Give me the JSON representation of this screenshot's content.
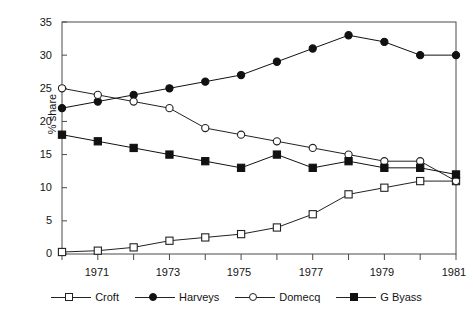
{
  "chart_data": {
    "type": "line",
    "title": "",
    "subtitle": "",
    "xlabel": "",
    "ylabel": "% share",
    "xlim": [
      1970,
      1981
    ],
    "ylim": [
      0,
      35
    ],
    "yticks": [
      0,
      5,
      10,
      15,
      20,
      25,
      30,
      35
    ],
    "xticks": [
      1970,
      1971,
      1972,
      1973,
      1974,
      1975,
      1976,
      1977,
      1978,
      1979,
      1980,
      1981
    ],
    "xtick_labels_shown": [
      "1971",
      "1973",
      "1975",
      "1977",
      "1979",
      "1981"
    ],
    "grid": false,
    "legend_position": "bottom",
    "x": [
      1970,
      1971,
      1972,
      1973,
      1974,
      1975,
      1976,
      1977,
      1978,
      1979,
      1980,
      1981
    ],
    "series": [
      {
        "name": "Croft",
        "marker": "open-square",
        "color": "#222222",
        "values": [
          0.3,
          0.5,
          1,
          2,
          2.5,
          3,
          4,
          6,
          9,
          10,
          11,
          11
        ]
      },
      {
        "name": "Harveys",
        "marker": "filled-circle",
        "color": "#111111",
        "values": [
          22,
          23,
          24,
          25,
          26,
          27,
          29,
          31,
          33,
          32,
          30,
          30
        ]
      },
      {
        "name": "Domecq",
        "marker": "open-circle",
        "color": "#222222",
        "values": [
          25,
          24,
          23,
          22,
          19,
          18,
          17,
          16,
          15,
          14,
          14,
          11
        ]
      },
      {
        "name": "G Byass",
        "marker": "filled-square",
        "color": "#111111",
        "values": [
          18,
          17,
          16,
          15,
          14,
          13,
          15,
          13,
          14,
          13,
          13,
          12
        ]
      }
    ]
  },
  "axis": {
    "ylabel": "% share",
    "ytick_labels": [
      "0",
      "5",
      "10",
      "15",
      "20",
      "25",
      "30",
      "35"
    ],
    "xtick_labels": [
      "1971",
      "1973",
      "1975",
      "1977",
      "1979",
      "1981"
    ]
  },
  "legend": {
    "items": [
      {
        "label": "Croft",
        "marker": "open-square"
      },
      {
        "label": "Harveys",
        "marker": "filled-circle"
      },
      {
        "label": "Domecq",
        "marker": "open-circle"
      },
      {
        "label": "G Byass",
        "marker": "filled-square"
      }
    ]
  }
}
